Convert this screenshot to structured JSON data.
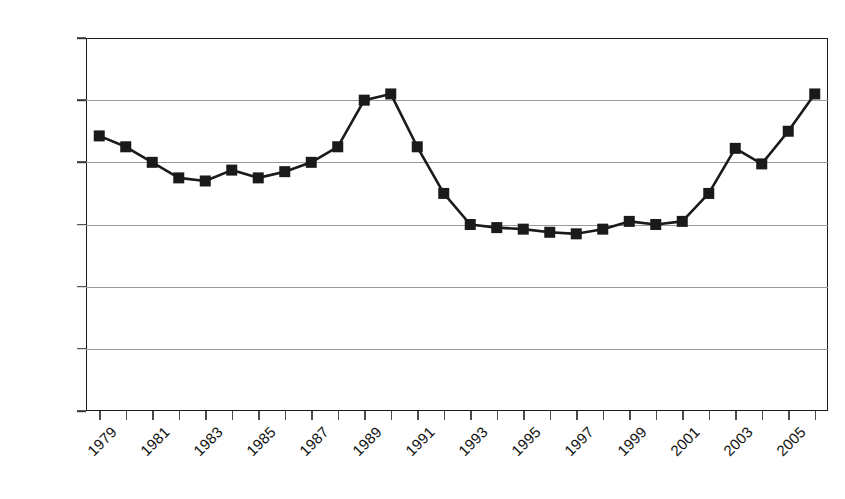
{
  "chart_data": {
    "type": "line",
    "title": "",
    "subtitle": "",
    "xlabel": "",
    "ylabel": "",
    "grid": true,
    "legend": "none",
    "marker": "square",
    "line_color": "#1a1a1a",
    "marker_color": "#1a1a1a",
    "grid_color": "#9a9a9a",
    "xlim": [
      1979,
      2006
    ],
    "ylim": [
      800,
      2000
    ],
    "yticks": [
      800,
      1000,
      1200,
      1400,
      1600,
      1800,
      2000
    ],
    "ytick_labels": [
      "800",
      "1000",
      "1200",
      "1400",
      "1600",
      "1800",
      "2000"
    ],
    "xticks": [
      1979,
      1980,
      1981,
      1982,
      1983,
      1984,
      1985,
      1986,
      1987,
      1988,
      1989,
      1990,
      1991,
      1992,
      1993,
      1994,
      1995,
      1996,
      1997,
      1998,
      1999,
      2000,
      2001,
      2002,
      2003,
      2004,
      2005,
      2006
    ],
    "xtick_labels": [
      "1979",
      "",
      "1981",
      "",
      "1983",
      "",
      "1985",
      "",
      "1987",
      "",
      "1989",
      "",
      "1991",
      "",
      "1993",
      "",
      "1995",
      "",
      "1997",
      "",
      "1999",
      "",
      "2001",
      "",
      "2003",
      "",
      "2005",
      ""
    ],
    "x": [
      1979,
      1980,
      1981,
      1982,
      1983,
      1984,
      1985,
      1986,
      1987,
      1988,
      1989,
      1990,
      1991,
      1992,
      1993,
      1994,
      1995,
      1996,
      1997,
      1998,
      1999,
      2000,
      2001,
      2002,
      2003,
      2004,
      2005,
      2006
    ],
    "values": [
      1685,
      1650,
      1600,
      1550,
      1540,
      1575,
      1550,
      1570,
      1600,
      1650,
      1800,
      1820,
      1650,
      1500,
      1400,
      1390,
      1385,
      1375,
      1370,
      1385,
      1410,
      1400,
      1410,
      1500,
      1645,
      1595,
      1700,
      1820
    ],
    "series": [
      {
        "name": "series-1",
        "values": [
          1685,
          1650,
          1600,
          1550,
          1540,
          1575,
          1550,
          1570,
          1600,
          1650,
          1800,
          1820,
          1650,
          1500,
          1400,
          1390,
          1385,
          1375,
          1370,
          1385,
          1410,
          1400,
          1410,
          1500,
          1645,
          1595,
          1700,
          1820
        ]
      }
    ]
  }
}
